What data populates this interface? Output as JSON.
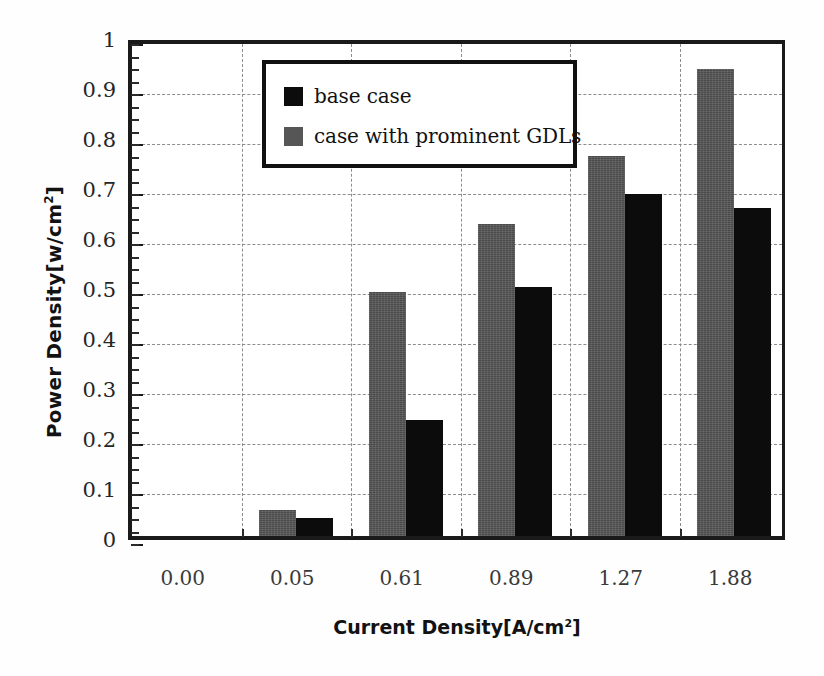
{
  "chart_data": {
    "type": "bar",
    "title": "",
    "xlabel": "Current Density[A/cm²]",
    "ylabel": "Power Density[w/cm²]",
    "categories": [
      "0.00",
      "0.05",
      "0.61",
      "0.89",
      "1.27",
      "1.88"
    ],
    "series": [
      {
        "name": "case with prominent GDLs",
        "color": "#565656",
        "values": [
          0.0,
          0.052,
          0.488,
          0.625,
          0.76,
          0.935
        ]
      },
      {
        "name": "base case",
        "color": "#0c0c0c",
        "values": [
          0.0,
          0.036,
          0.233,
          0.498,
          0.685,
          0.656
        ]
      }
    ],
    "ylim": [
      0,
      1
    ],
    "yticks": [
      "0",
      "0.1",
      "0.2",
      "0.3",
      "0.4",
      "0.5",
      "0.6",
      "0.7",
      "0.8",
      "0.9",
      "1"
    ],
    "ytick_values": [
      0,
      0.1,
      0.2,
      0.3,
      0.4,
      0.5,
      0.6,
      0.7,
      0.8,
      0.9,
      1
    ],
    "grid": "dashed-both",
    "legend_position": "top-left-inside",
    "legend_entries": [
      {
        "label": "base case",
        "color": "#0c0c0c"
      },
      {
        "label": "case with prominent GDLs",
        "color": "#565656"
      }
    ]
  },
  "axis": {
    "ylabel_main": "Power Density[w/cm",
    "ylabel_sup": "2",
    "ylabel_close": "]",
    "xlabel_main": "Current Density[A/cm",
    "xlabel_sup": "2",
    "xlabel_close": "]"
  }
}
